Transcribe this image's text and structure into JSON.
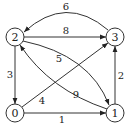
{
  "graph": {
    "type": "directed-weighted",
    "nodes": [
      {
        "id": "0",
        "label": "0",
        "x": 15,
        "y": 113
      },
      {
        "id": "1",
        "label": "1",
        "x": 115,
        "y": 113
      },
      {
        "id": "2",
        "label": "2",
        "x": 15,
        "y": 37
      },
      {
        "id": "3",
        "label": "3",
        "x": 115,
        "y": 37
      }
    ],
    "edges": [
      {
        "from": "3",
        "to": "2",
        "weight": "6"
      },
      {
        "from": "2",
        "to": "3",
        "weight": "8"
      },
      {
        "from": "2",
        "to": "0",
        "weight": "3"
      },
      {
        "from": "2",
        "to": "1",
        "weight": "5"
      },
      {
        "from": "1",
        "to": "2",
        "weight": "9"
      },
      {
        "from": "0",
        "to": "3",
        "weight": "4"
      },
      {
        "from": "0",
        "to": "1",
        "weight": "1"
      },
      {
        "from": "1",
        "to": "3",
        "weight": "2"
      }
    ]
  }
}
